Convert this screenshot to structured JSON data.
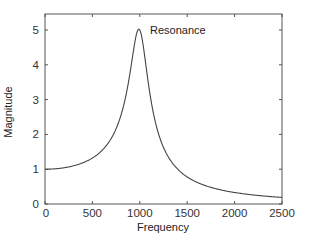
{
  "chart_data": {
    "type": "line",
    "title": "",
    "xlabel": "Frequency",
    "ylabel": "Magnitude",
    "xlim": [
      0,
      2500
    ],
    "ylim": [
      0,
      5.5
    ],
    "xticks": [
      0,
      500,
      1000,
      1500,
      2000,
      2500
    ],
    "yticks": [
      0,
      1,
      2,
      3,
      4,
      5
    ],
    "xtick_labels": [
      "0",
      "500",
      "1000",
      "1500",
      "2000",
      "2500"
    ],
    "ytick_labels": [
      "0",
      "1",
      "2",
      "3",
      "4",
      "5"
    ],
    "grid": false,
    "legend": null,
    "annotations": [
      {
        "text": "Resonance",
        "x": 1050,
        "y": 5.0
      }
    ],
    "series": [
      {
        "name": "Magnitude response",
        "color": "#444444",
        "model": "1/sqrt((1-(f/1000)^2)^2 + (2*0.1*(f/1000))^2)",
        "resonance_frequency": 1000,
        "damping_ratio": 0.1,
        "peak_magnitude": 5.0,
        "x": [
          0,
          250,
          500,
          700,
          800,
          900,
          950,
          1000,
          1050,
          1100,
          1200,
          1300,
          1500,
          1750,
          2000,
          2250,
          2500
        ],
        "values": [
          1.0,
          1.07,
          1.32,
          1.87,
          2.55,
          3.85,
          4.53,
          5.0,
          4.35,
          3.44,
          2.03,
          1.35,
          0.79,
          0.48,
          0.33,
          0.24,
          0.19
        ]
      }
    ]
  },
  "colors": {
    "axis": "#555555",
    "curve": "#444444",
    "text": "#222222",
    "background": "#ffffff"
  }
}
